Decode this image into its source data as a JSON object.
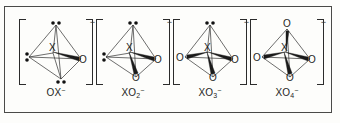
{
  "figure": {
    "border_color": "#4a4a48",
    "background": "#fdfdfb",
    "ink_color": "#2f2f2f"
  },
  "common": {
    "center_atom": "X",
    "oxygen_atom": "O",
    "charge": "−",
    "bracket_left": "[",
    "bracket_right": "]"
  },
  "species": [
    {
      "id": "ox-minus",
      "label_formula": "OX",
      "label_subscript": "",
      "label_superscript": "−",
      "center": "X",
      "lone_pairs": 3,
      "oxygens": 1,
      "vertices": [
        {
          "position": "top",
          "type": "lone-pair"
        },
        {
          "position": "left",
          "type": "lone-pair"
        },
        {
          "position": "bottom",
          "type": "lone-pair"
        },
        {
          "position": "right",
          "type": "oxygen",
          "symbol": "O"
        }
      ]
    },
    {
      "id": "xo2-minus",
      "label_formula": "XO",
      "label_subscript": "2",
      "label_superscript": "−",
      "center": "X",
      "lone_pairs": 2,
      "oxygens": 2,
      "vertices": [
        {
          "position": "top",
          "type": "lone-pair"
        },
        {
          "position": "left",
          "type": "lone-pair"
        },
        {
          "position": "right",
          "type": "oxygen",
          "symbol": "O"
        },
        {
          "position": "bottom",
          "type": "oxygen",
          "symbol": "O"
        }
      ]
    },
    {
      "id": "xo3-minus",
      "label_formula": "XO",
      "label_subscript": "3",
      "label_superscript": "−",
      "center": "X",
      "lone_pairs": 1,
      "oxygens": 3,
      "vertices": [
        {
          "position": "top",
          "type": "lone-pair"
        },
        {
          "position": "left",
          "type": "oxygen",
          "symbol": "O"
        },
        {
          "position": "right",
          "type": "oxygen",
          "symbol": "O"
        },
        {
          "position": "bottom",
          "type": "oxygen",
          "symbol": "O"
        }
      ]
    },
    {
      "id": "xo4-minus",
      "label_formula": "XO",
      "label_subscript": "4",
      "label_superscript": "−",
      "center": "X",
      "lone_pairs": 0,
      "oxygens": 4,
      "vertices": [
        {
          "position": "top",
          "type": "oxygen",
          "symbol": "O"
        },
        {
          "position": "left",
          "type": "oxygen",
          "symbol": "O"
        },
        {
          "position": "right",
          "type": "oxygen",
          "symbol": "O"
        },
        {
          "position": "bottom",
          "type": "oxygen",
          "symbol": "O"
        }
      ]
    }
  ]
}
